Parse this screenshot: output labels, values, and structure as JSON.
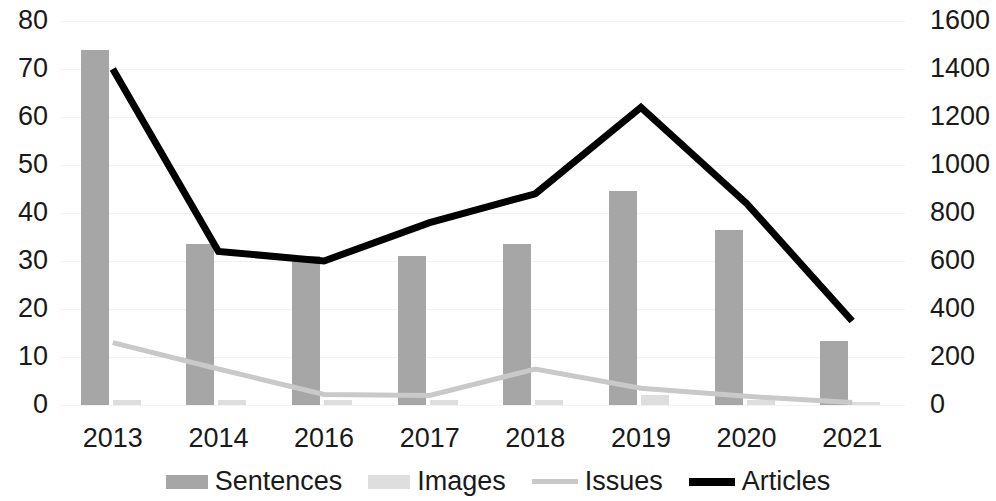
{
  "chart_data": {
    "type": "bar",
    "title": "",
    "subtitle": "",
    "xlabel": "",
    "ylabel": "",
    "y2label": "",
    "categories": [
      "2013",
      "2014",
      "2016",
      "2017",
      "2018",
      "2019",
      "2020",
      "2021"
    ],
    "ylim": [
      0,
      80
    ],
    "yticks": [
      0,
      10,
      20,
      30,
      40,
      50,
      60,
      70,
      80
    ],
    "y2lim": [
      0,
      1600
    ],
    "y2ticks": [
      0,
      200,
      400,
      600,
      800,
      1000,
      1200,
      1400,
      1600
    ],
    "grid": true,
    "legend_position": "bottom",
    "series": [
      {
        "name": "Sentences",
        "type": "bar",
        "axis": "left",
        "color": "#a6a6a6",
        "values": [
          74,
          33.5,
          31,
          31,
          33.5,
          44.5,
          36.5,
          13.3
        ]
      },
      {
        "name": "Images",
        "type": "bar",
        "axis": "left",
        "color": "#dedede",
        "values": [
          1,
          1,
          1,
          1,
          1,
          2,
          1,
          0.6
        ]
      },
      {
        "name": "Issues",
        "type": "line",
        "axis": "left",
        "color": "#c9c9c9",
        "values": [
          13,
          7.5,
          2.2,
          2,
          7.5,
          3.5,
          1.8,
          0.5
        ]
      },
      {
        "name": "Articles",
        "type": "line",
        "axis": "right",
        "color": "#000000",
        "values": [
          1400,
          640,
          600,
          760,
          880,
          1240,
          840,
          350
        ]
      }
    ]
  },
  "axes": {
    "left_ticks": [
      "80",
      "70",
      "60",
      "50",
      "40",
      "30",
      "20",
      "10",
      "0"
    ],
    "right_ticks": [
      "1600",
      "1400",
      "1200",
      "1000",
      "800",
      "600",
      "400",
      "200",
      "0"
    ],
    "x_ticks": [
      "2013",
      "2014",
      "2016",
      "2017",
      "2018",
      "2019",
      "2020",
      "2021"
    ]
  },
  "legend": {
    "items": [
      {
        "label": "Sentences",
        "marker": "bar-swatch-dark",
        "color": "#a6a6a6"
      },
      {
        "label": "Images",
        "marker": "bar-swatch-light",
        "color": "#dedede"
      },
      {
        "label": "Issues",
        "marker": "line-swatch-light",
        "color": "#c9c9c9"
      },
      {
        "label": "Articles",
        "marker": "line-swatch-dark",
        "color": "#000000"
      }
    ]
  },
  "colors": {
    "sentences": "#a6a6a6",
    "images": "#dedede",
    "issues": "#c9c9c9",
    "articles": "#000000",
    "grid": "#f2f2f2",
    "text": "#1a1a1a",
    "background": "#ffffff"
  }
}
